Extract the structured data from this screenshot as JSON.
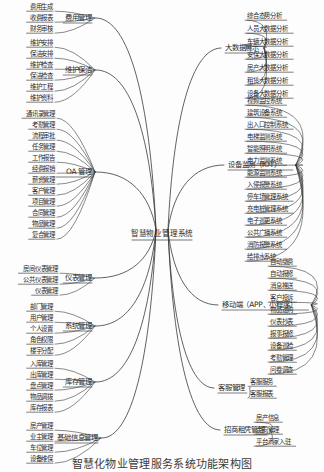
{
  "caption": "智慧化物业管理服务系统功能架构图",
  "root": {
    "label": "智慧物业管理系统",
    "x": 162,
    "y": 234
  },
  "colors": {
    "line": "#3a3a3a",
    "text": "#2b2b2b",
    "background": "#fdfdfd"
  },
  "branches": [
    {
      "id": "fee-management",
      "label": "费用管理",
      "side": "left",
      "x": 92,
      "y": 18,
      "leaves": [
        {
          "label": "费用生成",
          "x": 53,
          "y": 7
        },
        {
          "label": "收费报表",
          "x": 53,
          "y": 18
        },
        {
          "label": "财务审核",
          "x": 53,
          "y": 29
        }
      ]
    },
    {
      "id": "maintenance-cleaning",
      "label": "维护保洁",
      "side": "left",
      "x": 92,
      "y": 70,
      "leaves": [
        {
          "label": "维护安排",
          "x": 53,
          "y": 43
        },
        {
          "label": "保洁安排",
          "x": 53,
          "y": 54
        },
        {
          "label": "维护检查",
          "x": 53,
          "y": 65
        },
        {
          "label": "保洁检查",
          "x": 53,
          "y": 76
        },
        {
          "label": "维护工程",
          "x": 53,
          "y": 87
        },
        {
          "label": "维护资料",
          "x": 53,
          "y": 98
        }
      ]
    },
    {
      "id": "oa-management",
      "label": "OA 管理",
      "side": "left",
      "x": 92,
      "y": 172,
      "leaves": [
        {
          "label": "通讯录管理",
          "x": 55,
          "y": 114
        },
        {
          "label": "考勤管理",
          "x": 55,
          "y": 125
        },
        {
          "label": "流程审批",
          "x": 55,
          "y": 136
        },
        {
          "label": "任务管理",
          "x": 55,
          "y": 147
        },
        {
          "label": "工作报告",
          "x": 55,
          "y": 158
        },
        {
          "label": "经费报销",
          "x": 55,
          "y": 169
        },
        {
          "label": "薪资管理",
          "x": 55,
          "y": 180
        },
        {
          "label": "客户管理",
          "x": 55,
          "y": 191
        },
        {
          "label": "项目管理",
          "x": 55,
          "y": 202
        },
        {
          "label": "合同管理",
          "x": 55,
          "y": 213
        },
        {
          "label": "物品管理",
          "x": 55,
          "y": 224
        },
        {
          "label": "复合管理",
          "x": 55,
          "y": 235
        }
      ]
    },
    {
      "id": "meter-management",
      "label": "仪表管理",
      "side": "left",
      "x": 92,
      "y": 278,
      "leaves": [
        {
          "label": "房间仪表管理",
          "x": 58,
          "y": 269
        },
        {
          "label": "公共仪表管理",
          "x": 58,
          "y": 280
        },
        {
          "label": "仪表管理",
          "x": 58,
          "y": 291
        }
      ]
    },
    {
      "id": "system-management",
      "label": "系统管理",
      "side": "left",
      "x": 92,
      "y": 326,
      "leaves": [
        {
          "label": "部门管理",
          "x": 53,
          "y": 307
        },
        {
          "label": "用户管理",
          "x": 53,
          "y": 318
        },
        {
          "label": "个人设置",
          "x": 53,
          "y": 329
        },
        {
          "label": "角色权限",
          "x": 53,
          "y": 340
        },
        {
          "label": "楼宇分配",
          "x": 53,
          "y": 351
        }
      ]
    },
    {
      "id": "inventory-management",
      "label": "库存管理",
      "side": "left",
      "x": 92,
      "y": 382,
      "leaves": [
        {
          "label": "入库管理",
          "x": 53,
          "y": 364
        },
        {
          "label": "出库管理",
          "x": 53,
          "y": 375
        },
        {
          "label": "盘点管理",
          "x": 53,
          "y": 386
        },
        {
          "label": "物品调拨",
          "x": 53,
          "y": 397
        },
        {
          "label": "库存报表",
          "x": 53,
          "y": 408
        }
      ]
    },
    {
      "id": "basic-info-management",
      "label": "基础信息管理",
      "side": "left",
      "x": 98,
      "y": 438,
      "leaves": [
        {
          "label": "房产管理",
          "x": 53,
          "y": 426
        },
        {
          "label": "业主管理",
          "x": 53,
          "y": 437
        },
        {
          "label": "车位管理",
          "x": 53,
          "y": 448
        },
        {
          "label": "设备维保",
          "x": 53,
          "y": 459
        }
      ]
    },
    {
      "id": "big-data-display",
      "label": "大数据展示",
      "side": "right",
      "x": 225,
      "y": 48,
      "leaves": [
        {
          "label": "综合态势分析",
          "x": 247,
          "y": 16
        },
        {
          "label": "人员大数据分析",
          "x": 247,
          "y": 29
        },
        {
          "label": "车辆大数据分析",
          "x": 247,
          "y": 42
        },
        {
          "label": "安保大数据分析",
          "x": 247,
          "y": 55
        },
        {
          "label": "房产大数据分析",
          "x": 247,
          "y": 68
        },
        {
          "label": "租赁大数据分析",
          "x": 247,
          "y": 81
        },
        {
          "label": "设备大数据分析",
          "x": 247,
          "y": 94
        }
      ]
    },
    {
      "id": "iot-monitoring",
      "label": "设备监测（IOT）",
      "side": "right",
      "x": 228,
      "y": 165,
      "leaves": [
        {
          "label": "视频监控系统",
          "x": 247,
          "y": 101
        },
        {
          "label": "建筑设备系统",
          "x": 247,
          "y": 113
        },
        {
          "label": "出入口控制系统",
          "x": 247,
          "y": 125
        },
        {
          "label": "电梯监测系统",
          "x": 247,
          "y": 137
        },
        {
          "label": "智能照明系统",
          "x": 247,
          "y": 149
        },
        {
          "label": "电力监测系统",
          "x": 247,
          "y": 161
        },
        {
          "label": "能源监测系统",
          "x": 247,
          "y": 173
        },
        {
          "label": "入侵报警系统",
          "x": 247,
          "y": 185
        },
        {
          "label": "停车场管理系统",
          "x": 247,
          "y": 197
        },
        {
          "label": "充电桩管理系统",
          "x": 247,
          "y": 209
        },
        {
          "label": "电子巡更系统",
          "x": 247,
          "y": 221
        },
        {
          "label": "公共广播系统",
          "x": 247,
          "y": 233
        },
        {
          "label": "消防报警系统",
          "x": 247,
          "y": 245
        },
        {
          "label": "给排水系统",
          "x": 247,
          "y": 257
        }
      ]
    },
    {
      "id": "mobile-app",
      "label": "移动端（APP、小程序）",
      "side": "right",
      "x": 222,
      "y": 305,
      "leaves": [
        {
          "label": "自动缴费",
          "x": 270,
          "y": 262
        },
        {
          "label": "自动报修",
          "x": 270,
          "y": 274
        },
        {
          "label": "消息推送",
          "x": 270,
          "y": 286
        },
        {
          "label": "客户投诉",
          "x": 270,
          "y": 298
        },
        {
          "label": "物品递购",
          "x": 270,
          "y": 310
        },
        {
          "label": "仪表抄表",
          "x": 270,
          "y": 322
        },
        {
          "label": "报事报修",
          "x": 270,
          "y": 334
        },
        {
          "label": "设备巡检",
          "x": 270,
          "y": 346
        },
        {
          "label": "考勤管理",
          "x": 270,
          "y": 358
        },
        {
          "label": "问卷调查",
          "x": 270,
          "y": 370
        }
      ]
    },
    {
      "id": "customer-service",
      "label": "客服管理",
      "side": "right",
      "x": 218,
      "y": 388,
      "leaves": [
        {
          "label": "客服服务",
          "x": 250,
          "y": 382
        },
        {
          "label": "客服报表",
          "x": 250,
          "y": 394
        }
      ]
    },
    {
      "id": "leasing-management",
      "label": "招商租凭管理",
      "side": "right",
      "x": 224,
      "y": 430,
      "leaves": [
        {
          "label": "房产信息",
          "x": 256,
          "y": 418
        },
        {
          "label": "合同管理",
          "x": 256,
          "y": 430
        },
        {
          "label": "平台商家入驻",
          "x": 256,
          "y": 442
        }
      ]
    }
  ]
}
